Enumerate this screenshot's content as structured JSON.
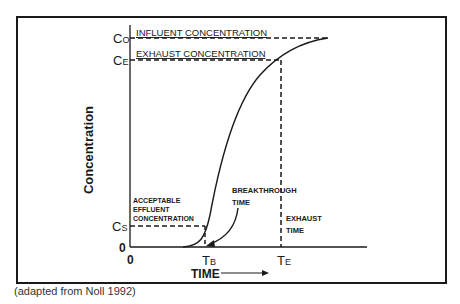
{
  "figure": {
    "y_axis_label": "Concentration",
    "x_axis_label": "TIME",
    "y_ticks": {
      "c0_main": "C",
      "c0_sub": "O",
      "ce_main": "C",
      "ce_sub": "E",
      "cs_main": "C",
      "cs_sub": "S",
      "zero": "0"
    },
    "x_ticks": {
      "zero": "0",
      "tb_main": "T",
      "tb_sub": "B",
      "te_main": "T",
      "te_sub": "E"
    },
    "annotations": {
      "influent": "INFLUENT CONCENTRATION",
      "exhaust": "EXHAUST CONCENTRATION",
      "acceptable_1": "ACCEPTABLE",
      "acceptable_2": "EFFLUENT",
      "acceptable_3": "CONCENTRATION",
      "breakthrough_1": "BREAKTHROUGH",
      "breakthrough_2": "TIME",
      "exhaust_time_1": "EXHAUST",
      "exhaust_time_2": "TIME"
    },
    "caption": "(adapted from Noll 1992)"
  },
  "colors": {
    "ink": "#1a1a1a",
    "background": "#ffffff"
  }
}
